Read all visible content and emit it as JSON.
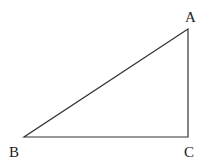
{
  "diagram": {
    "type": "right-triangle",
    "stroke_color": "#333333",
    "label_color": "#222222",
    "vertices": {
      "A": {
        "label": "A",
        "x": 188,
        "y": 29
      },
      "B": {
        "label": "B",
        "x": 24,
        "y": 137
      },
      "C": {
        "label": "C",
        "x": 188,
        "y": 137
      }
    },
    "edges": [
      {
        "from": "A",
        "to": "B",
        "name": "AB"
      },
      {
        "from": "B",
        "to": "C",
        "name": "BC"
      },
      {
        "from": "C",
        "to": "A",
        "name": "CA"
      }
    ],
    "right_angle_at": "C"
  }
}
